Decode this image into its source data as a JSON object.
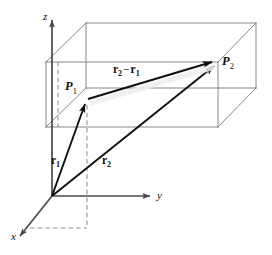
{
  "figure": {
    "kind": "vector-geometry-diagram",
    "width": 272,
    "height": 255,
    "background": "#ffffff",
    "line_color": "#59595d",
    "vector_color": "#111111",
    "dash_color": "#8d8d92",
    "box_color": "#7a7a80",
    "caption_ghost": "",
    "axes": {
      "z_label": "z",
      "y_label": "y",
      "x_label": "x",
      "origin_label": ""
    },
    "points": {
      "p1_label": "P",
      "p1_sub": "1",
      "p2_label": "P",
      "p2_sub": "2"
    },
    "vectors": {
      "r1_label": "r",
      "r1_sub": "1",
      "r2_label": "r",
      "r2_sub": "2",
      "diff_first": "r",
      "diff_first_sub": "2",
      "diff_operator": "−",
      "diff_second": "r",
      "diff_second_sub": "1"
    }
  }
}
